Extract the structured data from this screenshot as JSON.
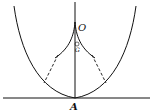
{
  "diagram": {
    "labels": {
      "origin": "O",
      "center": "G",
      "vertex": "A"
    },
    "colors": {
      "stroke": "#111111",
      "background": "#ffffff"
    }
  }
}
